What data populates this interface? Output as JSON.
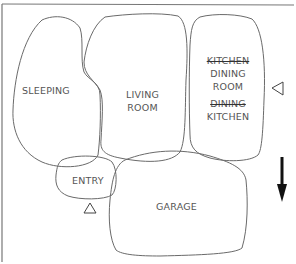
{
  "diagram": {
    "type": "bubble-diagram",
    "rooms": [
      {
        "id": "sleeping",
        "label": "SLEEPING"
      },
      {
        "id": "living",
        "label_line1": "LIVING",
        "label_line2": "ROOM"
      },
      {
        "id": "kitchen-dining",
        "struck_1": "KITCHEN",
        "line2": "DINING",
        "line3": "ROOM",
        "struck_2": "DINING",
        "line5": "KITCHEN"
      },
      {
        "id": "entry",
        "label": "ENTRY"
      },
      {
        "id": "garage",
        "label": "GARAGE"
      }
    ],
    "markers": {
      "entry_arrow": "triangle-up",
      "kitchen_arrow": "triangle-left",
      "north_arrow": "arrow-down"
    },
    "colors": {
      "stroke": "#6a6a6a",
      "text": "#555555",
      "arrow": "#111111"
    }
  }
}
